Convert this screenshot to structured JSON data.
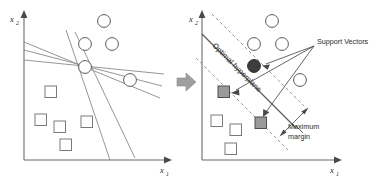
{
  "figure": {
    "width": 389,
    "height": 176,
    "background": "#ffffff"
  },
  "colors": {
    "axis": "#6b6b6b",
    "separator_line": "#8a8a8a",
    "hyperplane": "#5d5d5d",
    "margin_dashed": "#8c8c8c",
    "circle_open_stroke": "#5a5a5a",
    "circle_filled": "#3d3d3d",
    "square_open_stroke": "#7a7a7a",
    "square_filled": "#9a9a9a",
    "label_text": "#2b2b2b",
    "block_arrow": "#9e9e9e"
  },
  "left_panel": {
    "name": "many-possible-separators",
    "axes": {
      "y_label": "x",
      "y_subscript": "2",
      "x_label": "x",
      "x_subscript": "1"
    },
    "circles": [
      {
        "cx": 104,
        "cy": 21,
        "r": 6.4
      },
      {
        "cx": 85,
        "cy": 44,
        "r": 6.4
      },
      {
        "cx": 112,
        "cy": 44,
        "r": 6.4
      },
      {
        "cx": 85,
        "cy": 67,
        "r": 6.4
      },
      {
        "cx": 130,
        "cy": 80,
        "r": 6.4
      }
    ],
    "squares": [
      {
        "x": 45,
        "y": 86,
        "size": 11.5
      },
      {
        "x": 35,
        "y": 114,
        "size": 11.5
      },
      {
        "x": 54,
        "y": 121,
        "size": 11.5
      },
      {
        "x": 81,
        "y": 116,
        "size": 11.5
      },
      {
        "x": 60,
        "y": 139,
        "size": 11.5
      }
    ],
    "separator_lines": [
      {
        "x1": 24,
        "y1": 42,
        "x2": 160,
        "y2": 98
      },
      {
        "x1": 24,
        "y1": 50,
        "x2": 162,
        "y2": 86
      },
      {
        "x1": 24,
        "y1": 60,
        "x2": 164,
        "y2": 74
      },
      {
        "x1": 66,
        "y1": 30,
        "x2": 110,
        "y2": 160
      },
      {
        "x1": 75,
        "y1": 32,
        "x2": 135,
        "y2": 158
      }
    ]
  },
  "right_panel": {
    "name": "optimal-hyperplane-with-margin",
    "axes": {
      "y_label": "x",
      "y_subscript": "2",
      "x_label": "x",
      "x_subscript": "1"
    },
    "labels": {
      "hyperplane": "Optimal hyperplane",
      "support_vectors": "Support Vectors",
      "maximum_margin_line1": "Maximum",
      "maximum_margin_line2": "margin"
    },
    "circles_open": [
      {
        "cx": 272,
        "cy": 21,
        "r": 6.4
      },
      {
        "cx": 254,
        "cy": 44,
        "r": 6.4
      },
      {
        "cx": 282,
        "cy": 44,
        "r": 6.4
      },
      {
        "cx": 300,
        "cy": 80,
        "r": 6.4
      }
    ],
    "circles_filled": [
      {
        "cx": 254,
        "cy": 66,
        "r": 6.4,
        "role": "support-vector"
      }
    ],
    "squares_open": [
      {
        "x": 211,
        "y": 115,
        "size": 11.5
      },
      {
        "x": 230,
        "y": 124,
        "size": 11.5
      },
      {
        "x": 225,
        "y": 143,
        "size": 11.5
      }
    ],
    "squares_filled": [
      {
        "x": 218,
        "y": 86,
        "size": 11.5,
        "role": "support-vector"
      },
      {
        "x": 255,
        "y": 117,
        "size": 11.5,
        "role": "support-vector"
      }
    ],
    "hyperplane_line": {
      "x1": 202,
      "y1": 36,
      "x2": 292,
      "y2": 126
    },
    "margin_lines": [
      {
        "x1": 212,
        "y1": 14,
        "x2": 302,
        "y2": 104,
        "side": "upper"
      },
      {
        "x1": 196,
        "y1": 58,
        "x2": 286,
        "y2": 148,
        "side": "lower"
      }
    ]
  },
  "transition": {
    "arrow_name": "right-block-arrow",
    "direction": "right"
  }
}
